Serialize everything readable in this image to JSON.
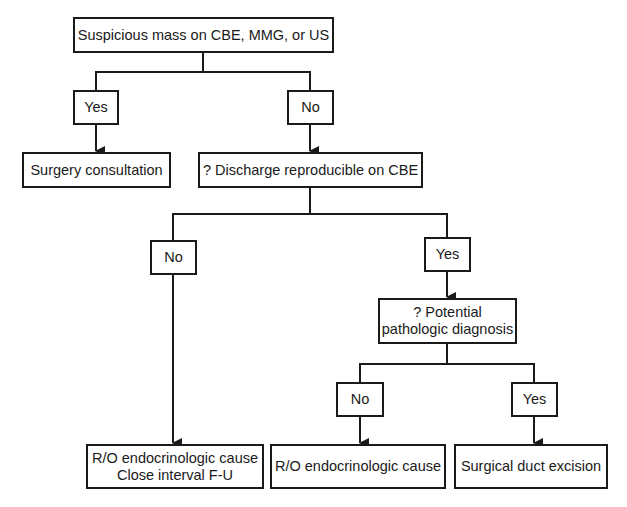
{
  "diagram": {
    "type": "flowchart",
    "nodes": {
      "root": {
        "text": "Suspicious mass on CBE, MMG, or US"
      },
      "yes1": {
        "text": "Yes"
      },
      "no1": {
        "text": "No"
      },
      "surgery": {
        "text": "Surgery consultation"
      },
      "discharge": {
        "text": "? Discharge reproducible on CBE"
      },
      "no2": {
        "text": "No"
      },
      "yes2": {
        "text": "Yes"
      },
      "potential": {
        "line1": "? Potential",
        "line2": "pathologic diagnosis"
      },
      "no3": {
        "text": "No"
      },
      "yes3": {
        "text": "Yes"
      },
      "endo_fu": {
        "line1": "R/O endocrinologic cause",
        "line2": "Close interval F-U"
      },
      "endo": {
        "text": "R/O endocrinologic cause"
      },
      "excision": {
        "text": "Surgical duct excision"
      }
    },
    "edges": [
      [
        "root",
        "yes1"
      ],
      [
        "root",
        "no1"
      ],
      [
        "yes1",
        "surgery"
      ],
      [
        "no1",
        "discharge"
      ],
      [
        "discharge",
        "no2"
      ],
      [
        "discharge",
        "yes2"
      ],
      [
        "no2",
        "endo_fu"
      ],
      [
        "yes2",
        "potential"
      ],
      [
        "potential",
        "no3"
      ],
      [
        "potential",
        "yes3"
      ],
      [
        "no3",
        "endo"
      ],
      [
        "yes3",
        "excision"
      ]
    ],
    "colors": {
      "stroke": "#1a1a1a",
      "background": "#ffffff"
    }
  }
}
